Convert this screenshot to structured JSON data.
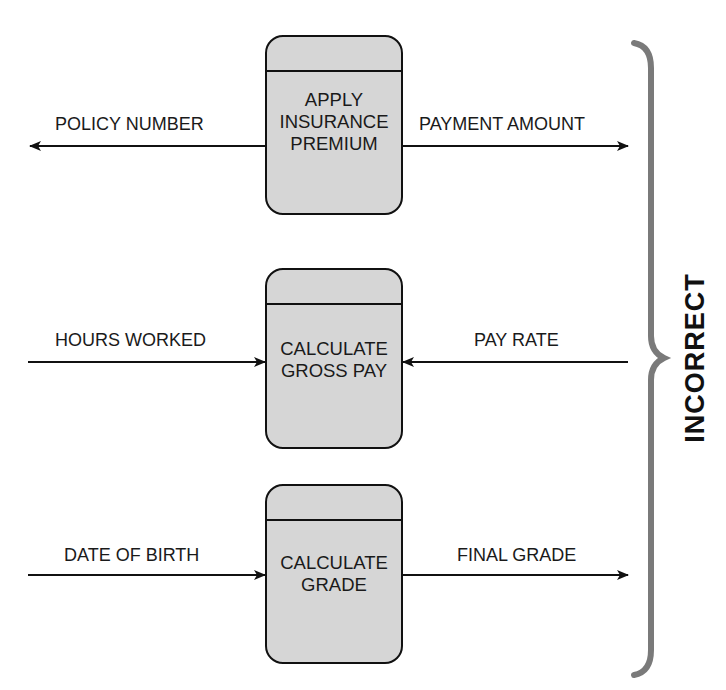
{
  "diagram": {
    "verdict_label": "INCORRECT",
    "processes": [
      {
        "name": "APPLY INSURANCE PREMIUM",
        "lines": [
          "APPLY",
          "INSURANCE",
          "PREMIUM"
        ],
        "left_flow": {
          "label": "POLICY NUMBER",
          "direction": "outgoing"
        },
        "right_flow": {
          "label": "PAYMENT AMOUNT",
          "direction": "outgoing"
        }
      },
      {
        "name": "CALCULATE GROSS PAY",
        "lines": [
          "CALCULATE",
          "GROSS PAY"
        ],
        "left_flow": {
          "label": "HOURS WORKED",
          "direction": "incoming"
        },
        "right_flow": {
          "label": "PAY RATE",
          "direction": "incoming"
        }
      },
      {
        "name": "CALCULATE GRADE",
        "lines": [
          "CALCULATE",
          "GRADE"
        ],
        "left_flow": {
          "label": "DATE OF BIRTH",
          "direction": "incoming"
        },
        "right_flow": {
          "label": "FINAL GRADE",
          "direction": "outgoing"
        }
      }
    ],
    "colors": {
      "process_fill": "#d6d6d6",
      "stroke": "#111111",
      "brace": "#7a7a7a"
    }
  }
}
